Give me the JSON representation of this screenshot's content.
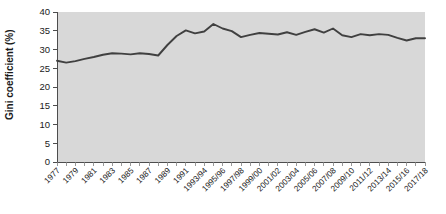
{
  "chart_data": {
    "type": "line",
    "title": "",
    "xlabel": "",
    "ylabel": "Gini coefficient (%)",
    "ylim": [
      0,
      40
    ],
    "ytick_labels": [
      "0",
      "5",
      "10",
      "15",
      "20",
      "25",
      "30",
      "35",
      "40"
    ],
    "ytick_values": [
      0,
      5,
      10,
      15,
      20,
      25,
      30,
      35,
      40
    ],
    "grid": false,
    "legend": "none",
    "background_color": "#d8d8d8",
    "line_color": "#404040",
    "x": [
      "1977",
      "1978",
      "1979",
      "1980",
      "1981",
      "1982",
      "1983",
      "1984",
      "1985",
      "1986",
      "1987",
      "1988",
      "1989",
      "1990",
      "1991",
      "1992",
      "1993/94",
      "1994/95",
      "1995/96",
      "1996/97",
      "1997/98",
      "1998/99",
      "1999/00",
      "2000/01",
      "2001/02",
      "2002/03",
      "2003/04",
      "2004/05",
      "2005/06",
      "2006/07",
      "2007/08",
      "2008/09",
      "2009/10",
      "2010/11",
      "2011/12",
      "2012/13",
      "2013/14",
      "2014/15",
      "2015/16",
      "2016/17",
      "2017/18"
    ],
    "xtick_labels": [
      "1977",
      "1979",
      "1981",
      "1983",
      "1985",
      "1987",
      "1989",
      "1991",
      "1993/94",
      "1995/96",
      "1997/98",
      "1999/00",
      "2001/02",
      "2003/04",
      "2005/06",
      "2007/08",
      "2009/10",
      "2011/12",
      "2013/14",
      "2015/16",
      "2017/18"
    ],
    "values": [
      27.0,
      26.5,
      26.9,
      27.5,
      28.0,
      28.6,
      29.0,
      28.9,
      28.7,
      29.0,
      28.8,
      28.4,
      31.2,
      33.6,
      35.1,
      34.3,
      34.8,
      36.8,
      35.6,
      34.9,
      33.3,
      33.9,
      34.4,
      34.2,
      34.0,
      34.6,
      33.9,
      34.7,
      35.4,
      34.5,
      35.6,
      33.8,
      33.3,
      34.1,
      33.8,
      34.1,
      33.9,
      33.1,
      32.4,
      33.0,
      33.0
    ]
  }
}
